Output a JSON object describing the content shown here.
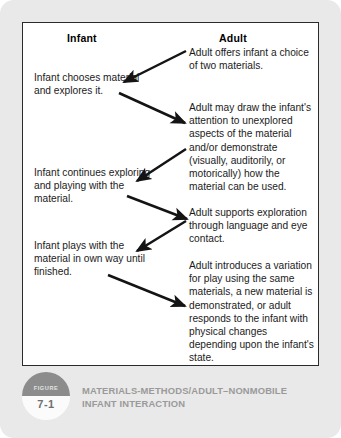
{
  "figure": {
    "badge_label": "FIGURE",
    "badge_number": "7-1",
    "caption": "MATERIALS-METHODS/ADULT–NONMOBILE INFANT INTERACTION"
  },
  "diagram": {
    "columns": {
      "left_header": "Infant",
      "right_header": "Adult"
    },
    "infant_steps": [
      "Infant chooses material and explores it.",
      "Infant continues exploring and playing with the material.",
      "Infant plays with the material in own way until finished."
    ],
    "adult_steps": [
      "Adult offers infant a choice of two materials.",
      "Adult may draw the infant's attention to unexplored aspects of the material and/or demonstrate (visually, auditorily, or motorically) how the material can be used.",
      "Adult supports exploration through language and eye contact.",
      "Adult introduces a variation for play using the same materials, a new material is demonstrated, or adult responds to the infant with physical changes depending upon the infant's state."
    ],
    "flow_arrows": [
      {
        "from": "adult_step_1",
        "to": "infant_step_1",
        "direction": "right-to-left"
      },
      {
        "from": "infant_step_1",
        "to": "adult_step_2",
        "direction": "left-to-right"
      },
      {
        "from": "adult_step_2",
        "to": "infant_step_2",
        "direction": "right-to-left"
      },
      {
        "from": "infant_step_2",
        "to": "adult_step_3",
        "direction": "left-to-right"
      },
      {
        "from": "adult_step_3",
        "to": "infant_step_3",
        "direction": "right-to-left"
      },
      {
        "from": "infant_step_3",
        "to": "adult_step_4",
        "direction": "left-to-right"
      }
    ],
    "colors": {
      "card_background": "#e9e9e9",
      "frame_border": "#2b2b2b",
      "frame_background": "#ffffff",
      "text": "#1b1b1b",
      "arrow": "#141414",
      "caption_text": "#9a9a9a",
      "badge_top": "#8c8c8c"
    }
  }
}
